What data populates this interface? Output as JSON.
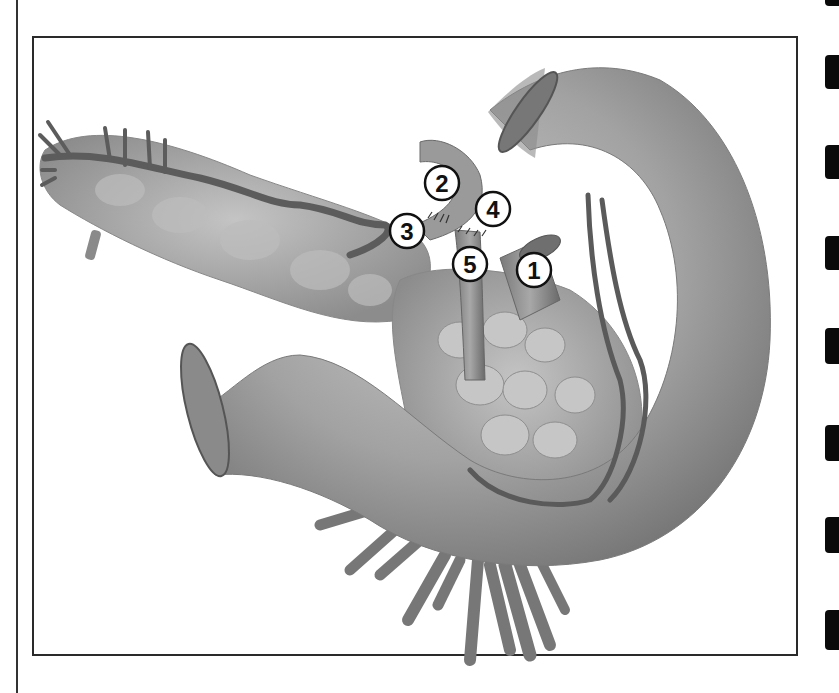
{
  "figure": {
    "type": "anatomical-illustration",
    "tone": "grayscale",
    "callouts": [
      {
        "label": "1",
        "x": 534,
        "y": 270
      },
      {
        "label": "2",
        "x": 442,
        "y": 183
      },
      {
        "label": "3",
        "x": 407,
        "y": 231
      },
      {
        "label": "4",
        "x": 493,
        "y": 209
      },
      {
        "label": "5",
        "x": 470,
        "y": 264
      }
    ]
  },
  "page_tabs": {
    "count": 8,
    "color": "#0a0a0a"
  },
  "colors": {
    "organ_light": "#b9b9b9",
    "organ_mid": "#9a9a9a",
    "organ_dark": "#6e6e6e",
    "vessel": "#5c5c5c",
    "frame": "#2a2a2a"
  }
}
